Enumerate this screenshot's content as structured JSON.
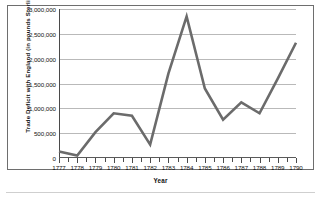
{
  "figure": {
    "y_axis_title": "Trade Deficit with England (in pounds Sterling)",
    "x_axis_title": "Year",
    "line_color": "#6b6b6b",
    "grid_color": "#b9b9b9",
    "frame_color": "#6e6e6e",
    "y_tick_labels": [
      "3,000,000",
      "2,500,000",
      "2,000,000",
      "1,500,000",
      "1,000,000",
      "500,000",
      "0"
    ]
  },
  "chart_data": {
    "type": "line",
    "title": "",
    "subtitle": "",
    "xlabel": "Year",
    "ylabel": "Trade Deficit with England (in pounds Sterling)",
    "x": [
      1777,
      1778,
      1779,
      1780,
      1781,
      1782,
      1783,
      1784,
      1785,
      1786,
      1787,
      1788,
      1789,
      1790
    ],
    "categories": [
      "1777",
      "1778",
      "1779",
      "1780",
      "1781",
      "1782",
      "1783",
      "1784",
      "1785",
      "1786",
      "1787",
      "1788",
      "1789",
      "1790"
    ],
    "values": [
      130000,
      50000,
      520000,
      900000,
      850000,
      270000,
      1700000,
      2850000,
      1400000,
      770000,
      1120000,
      900000,
      1600000,
      2320000
    ],
    "series": [
      {
        "name": "Trade Deficit with England",
        "color": "#6b6b6b",
        "values": [
          130000,
          50000,
          520000,
          900000,
          850000,
          270000,
          1700000,
          2850000,
          1400000,
          770000,
          1120000,
          900000,
          1600000,
          2320000
        ]
      }
    ],
    "ylim": [
      0,
      3000000
    ],
    "yticks": [
      0,
      500000,
      1000000,
      1500000,
      2000000,
      2500000,
      3000000
    ],
    "xlim": [
      1777,
      1790
    ],
    "xticks": [
      1777,
      1778,
      1779,
      1780,
      1781,
      1782,
      1783,
      1784,
      1785,
      1786,
      1787,
      1788,
      1789,
      1790
    ],
    "grid": "horizontal",
    "legend": "none",
    "annotations": []
  }
}
